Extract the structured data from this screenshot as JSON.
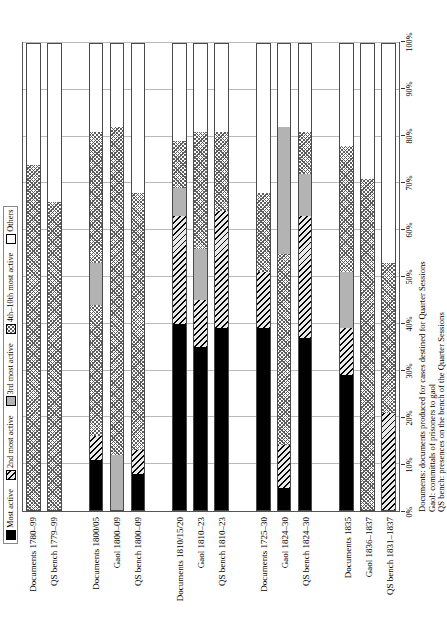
{
  "legend": {
    "items": [
      {
        "label": "Most active",
        "key": "most",
        "color": "#000000"
      },
      {
        "label": "2nd most active",
        "key": "2nd",
        "color": "#e9e9e9"
      },
      {
        "label": "3rd most active",
        "key": "3rd",
        "color": "#b3b3b3"
      },
      {
        "label": "4th–10th most active",
        "key": "4th",
        "color": "#ffffff"
      },
      {
        "label": "Others",
        "key": "others",
        "color": "#ffffff"
      }
    ]
  },
  "axis": {
    "ticks": [
      "0%",
      "10%",
      "20%",
      "30%",
      "40%",
      "50%",
      "60%",
      "70%",
      "80%",
      "90%",
      "100%"
    ],
    "min": 0,
    "max": 100
  },
  "footnote": {
    "lines": [
      "Documents: documents produced for cases destined for Quarter Sessions",
      "Gaol: committals of prisoners to gaol",
      "QS bench: presences on the bench of the Quarter Sessions"
    ]
  },
  "chart_data": {
    "type": "bar",
    "orientation": "horizontal",
    "stacked": true,
    "normalized": true,
    "title": "",
    "xlabel": "",
    "ylabel": "",
    "xlim": [
      0,
      100
    ],
    "grid": true,
    "legend_position": "top",
    "categories": [
      "Documents 1780–99",
      "QS bench 1779–99",
      "",
      "Documents 1800/05",
      "Gaol 1800–09",
      "QS bench 1800–09",
      "",
      "Documents 1810/15/20",
      "Gaol 1810–23",
      "QS bench 1810–23",
      "",
      "Documents 1725–30",
      "Gaol 1824–30",
      "QS bench 1824–30",
      "",
      "Documents 1835",
      "Gaol 1836–1837",
      "QS bench 1831–1837"
    ],
    "series": [
      {
        "name": "Most active",
        "values": [
          0,
          0,
          null,
          11,
          0,
          8,
          null,
          40,
          35,
          39,
          null,
          39,
          5,
          37,
          null,
          29,
          0,
          0
        ]
      },
      {
        "name": "2nd most active",
        "values": [
          0,
          0,
          null,
          5,
          0,
          5,
          null,
          0,
          0,
          0,
          null,
          0,
          9,
          0,
          null,
          0,
          0,
          0
        ]
      },
      {
        "name": "3rd most active",
        "values": [
          0,
          0,
          null,
          0,
          12,
          0,
          null,
          0,
          0,
          0,
          null,
          0,
          0,
          0,
          null,
          0,
          0,
          0
        ]
      },
      {
        "name": "4th–10th most active",
        "values": [
          0,
          0,
          null,
          0,
          0,
          0,
          null,
          22,
          14,
          24,
          null,
          0,
          9,
          23,
          null,
          10,
          0,
          0
        ]
      },
      {
        "name": "extra-hatch",
        "values": [
          74,
          66,
          null,
          16,
          0,
          53,
          null,
          0,
          0,
          0,
          null,
          29,
          0,
          0,
          null,
          0,
          0,
          0
        ]
      }
    ],
    "bars": [
      {
        "category": "Documents 1780–99",
        "segments": [
          {
            "k": "4th",
            "v": 74
          },
          {
            "k": "others",
            "v": 26
          }
        ]
      },
      {
        "category": "QS bench 1779–99",
        "segments": [
          {
            "k": "4th",
            "v": 66
          },
          {
            "k": "others",
            "v": 34
          }
        ]
      },
      {
        "category": "",
        "segments": []
      },
      {
        "category": "Documents 1800/05",
        "segments": [
          {
            "k": "most",
            "v": 11
          },
          {
            "k": "2nd",
            "v": 5
          },
          {
            "k": "4th",
            "v": 28
          },
          {
            "k": "3rd",
            "v": 9
          },
          {
            "k": "4th",
            "v": 28
          },
          {
            "k": "others",
            "v": 19
          }
        ]
      },
      {
        "category": "Gaol 1800–09",
        "segments": [
          {
            "k": "3rd",
            "v": 12
          },
          {
            "k": "4th",
            "v": 70
          },
          {
            "k": "others",
            "v": 18
          }
        ]
      },
      {
        "category": "QS bench 1800–09",
        "segments": [
          {
            "k": "most",
            "v": 8
          },
          {
            "k": "2nd",
            "v": 5
          },
          {
            "k": "4th",
            "v": 55
          },
          {
            "k": "others",
            "v": 32
          }
        ]
      },
      {
        "category": "",
        "segments": []
      },
      {
        "category": "Documents 1810/15/20",
        "segments": [
          {
            "k": "most",
            "v": 40
          },
          {
            "k": "2nd",
            "v": 23
          },
          {
            "k": "3rd",
            "v": 6
          },
          {
            "k": "4th",
            "v": 10
          },
          {
            "k": "others",
            "v": 21
          }
        ]
      },
      {
        "category": "Gaol 1810–23",
        "segments": [
          {
            "k": "most",
            "v": 35
          },
          {
            "k": "2nd",
            "v": 10
          },
          {
            "k": "3rd",
            "v": 11
          },
          {
            "k": "4th",
            "v": 25
          },
          {
            "k": "others",
            "v": 19
          }
        ]
      },
      {
        "category": "QS bench 1810–23",
        "segments": [
          {
            "k": "most",
            "v": 39
          },
          {
            "k": "2nd",
            "v": 25
          },
          {
            "k": "4th",
            "v": 17
          },
          {
            "k": "others",
            "v": 19
          }
        ]
      },
      {
        "category": "",
        "segments": []
      },
      {
        "category": "Documents 1725–30",
        "segments": [
          {
            "k": "most",
            "v": 39
          },
          {
            "k": "2nd",
            "v": 12
          },
          {
            "k": "4th",
            "v": 17
          },
          {
            "k": "others",
            "v": 32
          }
        ]
      },
      {
        "category": "Gaol 1824–30",
        "segments": [
          {
            "k": "most",
            "v": 5
          },
          {
            "k": "2nd",
            "v": 9
          },
          {
            "k": "4th",
            "v": 41
          },
          {
            "k": "3rd",
            "v": 27
          },
          {
            "k": "others",
            "v": 18
          }
        ]
      },
      {
        "category": "QS bench 1824–30",
        "segments": [
          {
            "k": "most",
            "v": 37
          },
          {
            "k": "2nd",
            "v": 26
          },
          {
            "k": "3rd",
            "v": 9
          },
          {
            "k": "4th",
            "v": 9
          },
          {
            "k": "others",
            "v": 19
          }
        ]
      },
      {
        "category": "",
        "segments": []
      },
      {
        "category": "Documents 1835",
        "segments": [
          {
            "k": "most",
            "v": 29
          },
          {
            "k": "2nd",
            "v": 10
          },
          {
            "k": "3rd",
            "v": 12
          },
          {
            "k": "4th",
            "v": 27
          },
          {
            "k": "others",
            "v": 22
          }
        ]
      },
      {
        "category": "Gaol 1836–1837",
        "segments": [
          {
            "k": "4th",
            "v": 71
          },
          {
            "k": "others",
            "v": 29
          }
        ]
      },
      {
        "category": "QS bench 1831–1837",
        "segments": [
          {
            "k": "2nd",
            "v": 21
          },
          {
            "k": "4th",
            "v": 32
          },
          {
            "k": "others",
            "v": 47
          }
        ]
      }
    ]
  }
}
